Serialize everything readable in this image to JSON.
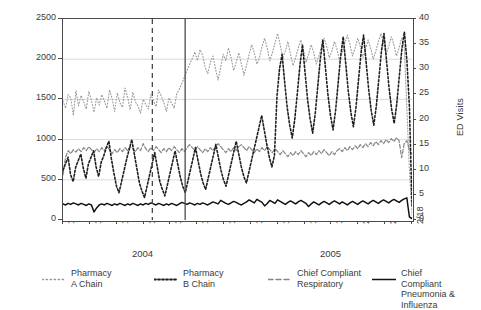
{
  "chart_data": {
    "type": "line",
    "title": "",
    "xlabel": "",
    "ylabel": "OTC Sales",
    "ylabel_right": "ED Visits",
    "ylim": [
      0,
      2500
    ],
    "ylim_right": [
      0,
      40
    ],
    "grid": true,
    "legend_position": "bottom",
    "y_ticks_left": [
      "0",
      "500",
      "1000",
      "1500",
      "2000",
      "2500"
    ],
    "y_ticks_right": [
      "0",
      "5",
      "10",
      "15",
      "20",
      "25",
      "30",
      "35",
      "40"
    ],
    "x_tick_labels": [
      "11/19",
      "11/26",
      "12/03",
      "12/10",
      "12/17",
      "12/24",
      "12/31",
      "1/07",
      "1/14",
      "1/21",
      "1/28",
      "2/04",
      "2/11",
      "2/18"
    ],
    "year_groups": [
      {
        "label": "2004",
        "start_tick": 0,
        "end_tick": 6
      },
      {
        "label": "2005",
        "start_tick": 7,
        "end_tick": 13
      }
    ],
    "annotations": [
      {
        "type": "vline",
        "style": "dashed",
        "x_frac": 0.256,
        "label": ""
      },
      {
        "type": "vline",
        "style": "solid",
        "x_frac": 0.35,
        "label": ""
      }
    ],
    "series": [
      {
        "name": "Pharmacy\nA Chain",
        "legend_label": "Pharmacy A Chain",
        "axis": "left",
        "color": "#9a9a9a",
        "dash": "1,2",
        "width": 1.1,
        "values": [
          1480,
          1390,
          1560,
          1520,
          1300,
          1610,
          1420,
          1550,
          1470,
          1380,
          1600,
          1490,
          1340,
          1520,
          1430,
          1560,
          1480,
          1390,
          1620,
          1510,
          1350,
          1580,
          1460,
          1400,
          1640,
          1530,
          1370,
          1590,
          1470,
          1420,
          1330,
          1500,
          1440,
          1380,
          1560,
          1480,
          1410,
          1620,
          1540,
          1460,
          1350,
          1520,
          1450,
          1390,
          1570,
          1630,
          1700,
          1780,
          1860,
          1940,
          2010,
          2090,
          1980,
          2120,
          2050,
          1900,
          1820,
          1960,
          2040,
          1880,
          1740,
          1900,
          2060,
          1980,
          2140,
          2020,
          1860,
          1960,
          2080,
          1940,
          1800,
          1920,
          2060,
          2180,
          2080,
          1940,
          2020,
          2160,
          2260,
          2140,
          1980,
          2080,
          2200,
          2320,
          2180,
          2020,
          2100,
          2220,
          2060,
          1920,
          2020,
          2140,
          2240,
          2120,
          1960,
          2060,
          2180,
          2080,
          1940,
          2040,
          2160,
          2260,
          2160,
          2020,
          2100,
          2220,
          2120,
          1980,
          2080,
          2200,
          2300,
          2180,
          2040,
          2140,
          2260,
          2160,
          2020,
          2120,
          2240,
          2140,
          2000,
          2100,
          2220,
          2320,
          2200,
          2060,
          2160,
          2280,
          2180,
          2040,
          2140,
          2260,
          2160,
          1400,
          620,
          60
        ]
      },
      {
        "name": "Pharmacy\nB Chain",
        "legend_label": "Pharmacy B Chain",
        "axis": "left",
        "color": "#1f1f1f",
        "dash": "2,2",
        "width": 1.6,
        "values": [
          620,
          700,
          780,
          560,
          480,
          660,
          740,
          820,
          640,
          520,
          700,
          780,
          860,
          660,
          540,
          720,
          800,
          900,
          980,
          760,
          580,
          420,
          340,
          480,
          620,
          760,
          880,
          1000,
          820,
          640,
          460,
          360,
          280,
          420,
          560,
          700,
          840,
          660,
          480,
          380,
          300,
          440,
          580,
          720,
          860,
          700,
          540,
          420,
          340,
          480,
          620,
          760,
          900,
          740,
          580,
          460,
          380,
          520,
          660,
          800,
          940,
          780,
          620,
          500,
          420,
          560,
          700,
          840,
          980,
          820,
          660,
          540,
          460,
          600,
          740,
          880,
          1020,
          1160,
          1300,
          1120,
          940,
          780,
          660,
          800,
          1540,
          1880,
          2060,
          1720,
          1400,
          1180,
          1020,
          1260,
          1580,
          1920,
          2180,
          1840,
          1500,
          1260,
          1080,
          1320,
          1660,
          2000,
          2240,
          1900,
          1560,
          1300,
          1120,
          1360,
          1700,
          2040,
          2280,
          1940,
          1600,
          1340,
          1160,
          1400,
          1740,
          2080,
          2300,
          1960,
          1620,
          1360,
          1180,
          1420,
          1760,
          2100,
          2320,
          1980,
          1640,
          1380,
          1200,
          1440,
          1780,
          2120,
          2340,
          1980,
          1400,
          180
        ]
      },
      {
        "name": "Chief Compliant\nRespiratory",
        "legend_label": "Chief Compliant Respiratory",
        "axis": "right",
        "color": "#858585",
        "dash": "4,2",
        "width": 1.2,
        "values": [
          9.0,
          12.5,
          13.8,
          13.2,
          14.0,
          13.5,
          14.2,
          13.6,
          14.4,
          13.8,
          14.6,
          14.0,
          13.4,
          14.2,
          13.6,
          14.4,
          13.8,
          14.6,
          14.0,
          13.2,
          14.0,
          13.4,
          14.2,
          13.6,
          14.4,
          13.8,
          14.6,
          14.2,
          13.6,
          14.4,
          13.8,
          15.2,
          14.2,
          13.6,
          14.4,
          13.8,
          14.6,
          14.0,
          13.4,
          14.2,
          13.6,
          14.4,
          13.8,
          14.6,
          14.0,
          13.4,
          14.2,
          13.6,
          14.4,
          15.0,
          14.4,
          13.8,
          14.6,
          14.0,
          13.4,
          14.2,
          13.6,
          14.4,
          13.8,
          14.6,
          15.2,
          14.6,
          14.0,
          13.4,
          14.2,
          13.6,
          14.4,
          13.8,
          14.6,
          15.0,
          14.4,
          13.8,
          14.6,
          14.0,
          13.4,
          14.2,
          13.6,
          14.4,
          13.8,
          14.6,
          14.0,
          13.4,
          14.2,
          13.6,
          13.0,
          13.8,
          13.2,
          12.6,
          13.4,
          12.8,
          13.6,
          13.0,
          13.8,
          13.2,
          12.6,
          13.4,
          12.8,
          13.6,
          13.0,
          13.8,
          13.2,
          14.0,
          13.4,
          12.8,
          13.6,
          13.0,
          13.8,
          14.2,
          13.6,
          14.4,
          13.8,
          14.6,
          14.0,
          14.8,
          14.2,
          15.0,
          14.4,
          15.2,
          14.6,
          15.4,
          14.8,
          15.6,
          15.0,
          15.8,
          15.2,
          16.0,
          15.4,
          16.2,
          15.6,
          16.4,
          15.8,
          12.4,
          15.2,
          15.8,
          14.0,
          13.0
        ]
      },
      {
        "name": "Chief Compliant\nPneumonia & Influenza",
        "legend_label": "Chief Compliant Pneumonia & Influenza",
        "axis": "right",
        "color": "#111111",
        "dash": "",
        "width": 1.5,
        "values": [
          3.2,
          3.0,
          3.3,
          3.1,
          3.4,
          3.2,
          3.0,
          3.3,
          3.1,
          2.9,
          3.2,
          3.0,
          1.6,
          2.4,
          3.0,
          3.2,
          3.0,
          3.3,
          3.1,
          2.9,
          3.2,
          3.0,
          3.3,
          3.1,
          2.9,
          3.2,
          3.0,
          3.3,
          3.1,
          2.9,
          3.2,
          3.0,
          3.3,
          3.1,
          3.4,
          3.2,
          3.0,
          3.3,
          3.1,
          2.9,
          3.2,
          3.0,
          3.3,
          3.1,
          2.9,
          3.2,
          3.5,
          3.3,
          3.1,
          3.4,
          3.2,
          3.0,
          3.3,
          3.1,
          3.4,
          3.2,
          3.0,
          3.3,
          3.6,
          3.4,
          3.2,
          3.9,
          3.6,
          3.3,
          3.1,
          3.4,
          3.7,
          3.5,
          3.2,
          3.0,
          3.3,
          3.6,
          4.0,
          3.7,
          3.4,
          4.1,
          3.8,
          3.5,
          2.8,
          3.3,
          3.9,
          3.6,
          3.3,
          4.0,
          3.7,
          3.4,
          3.1,
          3.5,
          3.8,
          3.5,
          3.2,
          3.6,
          3.9,
          3.6,
          3.3,
          2.7,
          3.2,
          3.6,
          3.3,
          3.0,
          3.4,
          3.7,
          3.4,
          3.1,
          3.5,
          3.8,
          3.5,
          3.2,
          3.6,
          3.3,
          3.0,
          3.4,
          3.7,
          3.4,
          3.1,
          3.5,
          3.8,
          3.5,
          3.2,
          3.6,
          3.9,
          3.6,
          3.3,
          3.7,
          4.0,
          3.7,
          3.4,
          3.8,
          4.1,
          3.8,
          3.5,
          3.9,
          4.2,
          4.4,
          0.6,
          0.3
        ]
      }
    ]
  }
}
